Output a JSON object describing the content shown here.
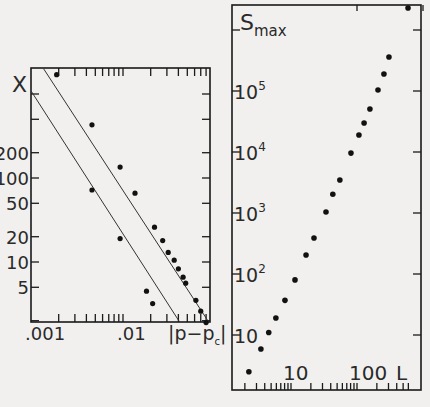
{
  "chart_data": [
    {
      "type": "scatter",
      "title": "",
      "xlabel": "|p-p_c|",
      "ylabel": "X",
      "xscale": "log",
      "yscale": "log",
      "xlim": [
        0.001,
        0.09
      ],
      "ylim": [
        1.8,
        2000
      ],
      "x_tick_labels": [
        ".001",
        ".01"
      ],
      "y_tick_labels": [
        "5",
        "10",
        "20",
        "50",
        "100",
        "200"
      ],
      "grid": false,
      "legend": null,
      "series": [
        {
          "name": "upper series (with fit line)",
          "x": [
            0.0019,
            0.0046,
            0.0093,
            0.0135,
            0.022,
            0.027,
            0.031,
            0.036,
            0.04,
            0.045,
            0.048,
            0.062,
            0.07,
            0.08
          ],
          "y": [
            1700,
            430,
            135,
            66,
            26,
            18,
            13,
            10.5,
            8.3,
            6.6,
            5.6,
            3.5,
            2.6,
            1.9
          ],
          "fit_line": {
            "x": [
              0.00137,
              0.089
            ],
            "y": [
              2000,
              1.8
            ]
          }
        },
        {
          "name": "lower series (with fit line)",
          "x": [
            0.0046,
            0.0093,
            0.018,
            0.021
          ],
          "y": [
            72,
            19,
            4.5,
            3.2
          ],
          "fit_line": {
            "x": [
              0.001,
              0.043
            ],
            "y": [
              1090,
              1.8
            ]
          }
        }
      ]
    },
    {
      "type": "scatter",
      "title": "",
      "xlabel": "L",
      "ylabel": "S_max",
      "xscale": "log",
      "yscale": "log",
      "xlim": [
        1.6,
        700
      ],
      "ylim": [
        1.2,
        3000000
      ],
      "x_tick_labels": [
        "10",
        "100"
      ],
      "y_tick_labels": [
        "10",
        "10^2",
        "10^3",
        "10^4",
        "10^5"
      ],
      "grid": false,
      "legend": null,
      "series": [
        {
          "name": "S_max vs L",
          "x": [
            2.3,
            3.5,
            4.6,
            5.9,
            8.1,
            11.5,
            16.9,
            22.3,
            33.9,
            43,
            55,
            81,
            107,
            128,
            157,
            208,
            256,
            305,
            593
          ],
          "y": [
            2.5,
            5.9,
            11,
            19,
            37,
            80,
            205,
            390,
            1040,
            2030,
            3470,
            9600,
            19000,
            29900,
            50700,
            104000,
            190000,
            360000,
            2300000
          ]
        }
      ]
    }
  ],
  "labels": {
    "left_y": "X",
    "left_x": "|p−p",
    "left_x_sub": "c",
    "left_x_close": "|",
    "left_xticks": [
      ".001",
      ".01"
    ],
    "left_yticks": [
      "5",
      "10",
      "20",
      "50",
      "100",
      "200"
    ],
    "right_y_main": "S",
    "right_y_sub": "max",
    "right_x": "L",
    "right_xticks": [
      "10",
      "100"
    ],
    "right_yticks_base": [
      "10",
      "10",
      "10",
      "10",
      "10"
    ],
    "right_yticks_exp": [
      "",
      "2",
      "3",
      "4",
      "5"
    ]
  },
  "colors": {
    "ink": "#1a1a1a",
    "paper": "#f1f0ee"
  }
}
